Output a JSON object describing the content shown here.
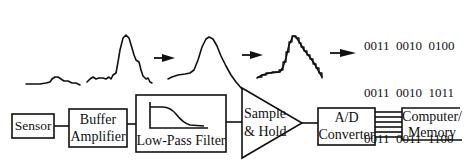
{
  "blocks": [
    {
      "id": "sensor",
      "label": "Sensor"
    },
    {
      "id": "buffer",
      "label_line1": "Buffer",
      "label_line2": "Amplifier"
    },
    {
      "id": "lpf",
      "label": "Low-Pass Filter"
    },
    {
      "id": "sh",
      "label_line1": "Sample",
      "label_line2": "& Hold"
    },
    {
      "id": "adc",
      "label_line1": "A/D",
      "label_line2": "Converter"
    },
    {
      "id": "computer",
      "label_line1": "Computer/",
      "label_line2": "Memory"
    }
  ],
  "digital_output": {
    "rows": [
      "0011  0010  0100",
      "0011  0010  1011",
      "0011  0011  1100",
      "0011  0101  0111",
      "  :       :       :",
      "  :       :       :"
    ]
  },
  "waveform_stages": [
    "raw sensor signal",
    "amplified signal",
    "filtered signal",
    "sampled & quantized signal"
  ],
  "colors": {
    "ink": "#111111",
    "background": "#ffffff"
  }
}
